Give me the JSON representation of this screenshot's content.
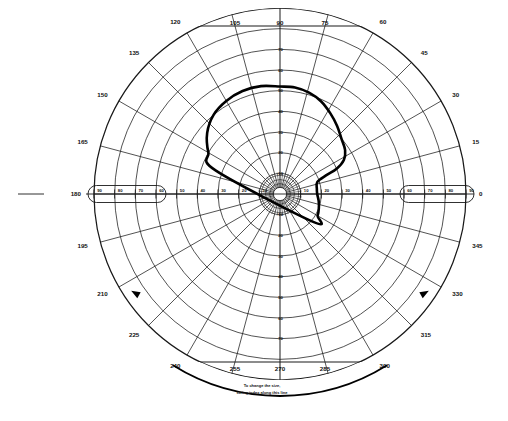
{
  "chart_data": {
    "type": "scatter",
    "subtype": "polar-visual-field-perimetry",
    "title": "",
    "xlabel": "",
    "ylabel": "",
    "grid": true,
    "legend_position": "none",
    "center": {
      "x": 280,
      "y": 194
    },
    "max_radius_px": 186,
    "radial_axis": {
      "label": "Eccentricity (degrees)",
      "range": [
        0,
        90
      ],
      "tick_step": 10,
      "ticks": [
        10,
        20,
        30,
        40,
        50,
        60,
        70,
        80,
        90
      ],
      "ring_radii_deg": [
        10,
        20,
        30,
        40,
        50,
        60,
        70,
        80,
        90
      ]
    },
    "angular_axis": {
      "label": "Meridian (degrees)",
      "range": [
        0,
        360
      ],
      "tick_step": 15,
      "ticks": [
        0,
        15,
        30,
        45,
        60,
        75,
        90,
        105,
        120,
        135,
        150,
        165,
        180,
        195,
        210,
        225,
        240,
        255,
        270,
        285,
        300,
        315,
        330,
        345
      ]
    },
    "horizontal_ticks_left": [
      "90",
      "80",
      "70",
      "60",
      "50",
      "40",
      "30",
      "20",
      "10"
    ],
    "horizontal_ticks_right": [
      "10",
      "20",
      "30",
      "40",
      "50",
      "60",
      "70",
      "80",
      "90"
    ],
    "vertical_ticks_up": [
      "70",
      "60",
      "50",
      "40",
      "30",
      "20",
      "10"
    ],
    "vertical_ticks_down": [
      "10",
      "20",
      "30",
      "40",
      "50",
      "60",
      "70"
    ],
    "series": [
      {
        "name": "isopter-contour",
        "style": "closed thick curve",
        "points_deg": [
          {
            "angle": 90,
            "r": 52
          },
          {
            "angle": 82,
            "r": 52
          },
          {
            "angle": 74,
            "r": 51
          },
          {
            "angle": 66,
            "r": 49
          },
          {
            "angle": 58,
            "r": 46
          },
          {
            "angle": 50,
            "r": 43
          },
          {
            "angle": 42,
            "r": 40
          },
          {
            "angle": 34,
            "r": 38
          },
          {
            "angle": 28,
            "r": 35
          },
          {
            "angle": 24,
            "r": 30
          },
          {
            "angle": 22,
            "r": 24
          },
          {
            "angle": 18,
            "r": 19
          },
          {
            "angle": 8,
            "r": 18
          },
          {
            "angle": 0,
            "r": 18
          },
          {
            "angle": 350,
            "r": 19
          },
          {
            "angle": 340,
            "r": 20
          },
          {
            "angle": 330,
            "r": 21
          },
          {
            "angle": 320,
            "r": 21
          },
          {
            "angle": 160,
            "r": 33
          },
          {
            "angle": 150,
            "r": 40
          },
          {
            "angle": 140,
            "r": 46
          },
          {
            "angle": 130,
            "r": 50
          },
          {
            "angle": 120,
            "r": 52
          },
          {
            "angle": 110,
            "r": 53
          },
          {
            "angle": 100,
            "r": 53
          }
        ]
      }
    ]
  },
  "meridian_labels": [
    {
      "deg": 0,
      "text": "0"
    },
    {
      "deg": 15,
      "text": "15"
    },
    {
      "deg": 30,
      "text": "30"
    },
    {
      "deg": 45,
      "text": "45"
    },
    {
      "deg": 60,
      "text": "60"
    },
    {
      "deg": 75,
      "text": "75"
    },
    {
      "deg": 90,
      "text": "90"
    },
    {
      "deg": 105,
      "text": "105"
    },
    {
      "deg": 120,
      "text": "120"
    },
    {
      "deg": 135,
      "text": "135"
    },
    {
      "deg": 150,
      "text": "150"
    },
    {
      "deg": 165,
      "text": "165"
    },
    {
      "deg": 180,
      "text": "180"
    },
    {
      "deg": 195,
      "text": "195"
    },
    {
      "deg": 210,
      "text": "210"
    },
    {
      "deg": 225,
      "text": "225"
    },
    {
      "deg": 240,
      "text": "240"
    },
    {
      "deg": 255,
      "text": "255"
    },
    {
      "deg": 270,
      "text": "270"
    },
    {
      "deg": 285,
      "text": "285"
    },
    {
      "deg": 300,
      "text": "300"
    },
    {
      "deg": 315,
      "text": "315"
    },
    {
      "deg": 330,
      "text": "330"
    },
    {
      "deg": 345,
      "text": "345"
    }
  ],
  "annotation": {
    "line1": "To change the size,",
    "line2": "swing index along this line"
  },
  "colors": {
    "grid": "#1a1a1a",
    "contour": "#000000",
    "text": "#111111",
    "background": "#ffffff"
  }
}
